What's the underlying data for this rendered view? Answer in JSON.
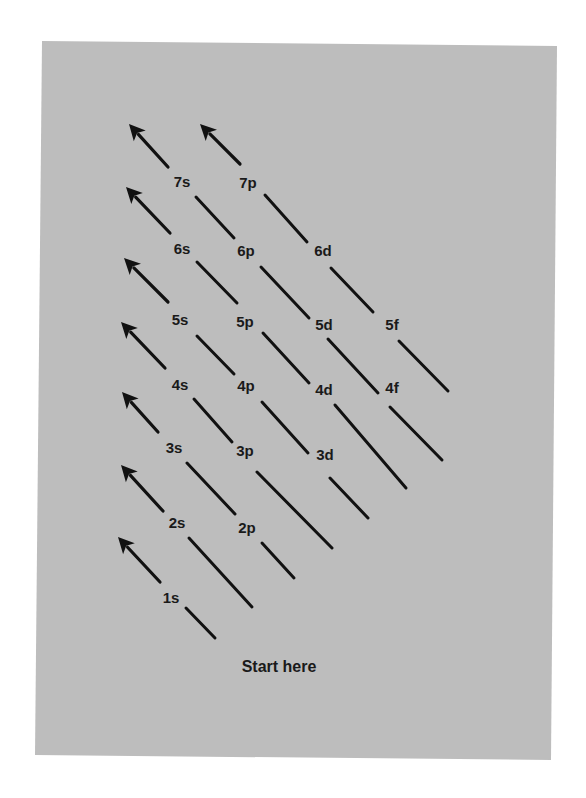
{
  "diagram": {
    "colors": {
      "page_background": "#ffffff",
      "panel_background": "#bdbdbd",
      "ink": "#111111"
    },
    "panel_polygon": [
      [
        42,
        41
      ],
      [
        557,
        46
      ],
      [
        551,
        760
      ],
      [
        35,
        755
      ]
    ],
    "start_label": "Start here",
    "start_label_pos": [
      279,
      672
    ],
    "orbitals": [
      {
        "id": "1s",
        "label": "1s",
        "x": 171,
        "y": 603
      },
      {
        "id": "2s",
        "label": "2s",
        "x": 177,
        "y": 528
      },
      {
        "id": "2p",
        "label": "2p",
        "x": 247,
        "y": 533
      },
      {
        "id": "3s",
        "label": "3s",
        "x": 174,
        "y": 453
      },
      {
        "id": "3p",
        "label": "3p",
        "x": 245,
        "y": 456
      },
      {
        "id": "3d",
        "label": "3d",
        "x": 325,
        "y": 460
      },
      {
        "id": "4s",
        "label": "4s",
        "x": 180,
        "y": 390
      },
      {
        "id": "4p",
        "label": "4p",
        "x": 246,
        "y": 391
      },
      {
        "id": "4d",
        "label": "4d",
        "x": 324,
        "y": 395
      },
      {
        "id": "4f",
        "label": "4f",
        "x": 392,
        "y": 393
      },
      {
        "id": "5s",
        "label": "5s",
        "x": 180,
        "y": 325
      },
      {
        "id": "5p",
        "label": "5p",
        "x": 245,
        "y": 327
      },
      {
        "id": "5d",
        "label": "5d",
        "x": 324,
        "y": 330
      },
      {
        "id": "5f",
        "label": "5f",
        "x": 392,
        "y": 330
      },
      {
        "id": "6s",
        "label": "6s",
        "x": 182,
        "y": 254
      },
      {
        "id": "6p",
        "label": "6p",
        "x": 246,
        "y": 256
      },
      {
        "id": "6d",
        "label": "6d",
        "x": 323,
        "y": 256
      },
      {
        "id": "7s",
        "label": "7s",
        "x": 182,
        "y": 187
      },
      {
        "id": "7p",
        "label": "7p",
        "x": 248,
        "y": 188
      }
    ],
    "arrows": [
      {
        "id": "arrow-1s",
        "from": [
          160,
          582
        ],
        "to": [
          118,
          537
        ]
      },
      {
        "id": "arrow-2s",
        "from": [
          163,
          511
        ],
        "to": [
          121,
          465
        ]
      },
      {
        "id": "arrow-3s",
        "from": [
          158,
          432
        ],
        "to": [
          122,
          392
        ]
      },
      {
        "id": "arrow-4s",
        "from": [
          165,
          368
        ],
        "to": [
          121,
          322
        ]
      },
      {
        "id": "arrow-5s",
        "from": [
          168,
          302
        ],
        "to": [
          124,
          258
        ]
      },
      {
        "id": "arrow-6s",
        "from": [
          170,
          233
        ],
        "to": [
          126,
          187
        ]
      },
      {
        "id": "arrow-7s",
        "from": [
          168,
          167
        ],
        "to": [
          129,
          124
        ]
      },
      {
        "id": "arrow-7p",
        "from": [
          240,
          164
        ],
        "to": [
          200,
          124
        ]
      }
    ],
    "lines": [
      {
        "id": "line-start-1s",
        "from": [
          186,
          608
        ],
        "to": [
          215,
          638
        ]
      },
      {
        "id": "line-2s-end",
        "from": [
          189,
          538
        ],
        "to": [
          252,
          607
        ]
      },
      {
        "id": "line-2p-end",
        "from": [
          262,
          543
        ],
        "to": [
          294,
          578
        ]
      },
      {
        "id": "line-3s-2p",
        "from": [
          187,
          463
        ],
        "to": [
          235,
          514
        ]
      },
      {
        "id": "line-3p-end",
        "from": [
          257,
          472
        ],
        "to": [
          332,
          548
        ]
      },
      {
        "id": "line-3d-end",
        "from": [
          330,
          478
        ],
        "to": [
          368,
          518
        ]
      },
      {
        "id": "line-4s-3p",
        "from": [
          194,
          399
        ],
        "to": [
          232,
          442
        ]
      },
      {
        "id": "line-4p-3d",
        "from": [
          262,
          402
        ],
        "to": [
          308,
          453
        ]
      },
      {
        "id": "line-4d-end",
        "from": [
          335,
          405
        ],
        "to": [
          406,
          488
        ]
      },
      {
        "id": "line-4f-end",
        "from": [
          390,
          407
        ],
        "to": [
          442,
          460
        ]
      },
      {
        "id": "line-5s-4p",
        "from": [
          197,
          336
        ],
        "to": [
          234,
          374
        ]
      },
      {
        "id": "line-5p-4d",
        "from": [
          263,
          333
        ],
        "to": [
          309,
          383
        ]
      },
      {
        "id": "line-5d-4f",
        "from": [
          328,
          339
        ],
        "to": [
          378,
          393
        ]
      },
      {
        "id": "line-5f-end",
        "from": [
          399,
          341
        ],
        "to": [
          448,
          391
        ]
      },
      {
        "id": "line-6s-5p",
        "from": [
          197,
          262
        ],
        "to": [
          237,
          303
        ]
      },
      {
        "id": "line-6p-5d",
        "from": [
          261,
          267
        ],
        "to": [
          309,
          318
        ]
      },
      {
        "id": "line-6d-5f",
        "from": [
          331,
          268
        ],
        "to": [
          373,
          312
        ]
      },
      {
        "id": "line-7s-6p",
        "from": [
          196,
          197
        ],
        "to": [
          234,
          238
        ]
      },
      {
        "id": "line-7p-6d",
        "from": [
          265,
          195
        ],
        "to": [
          307,
          242
        ]
      }
    ]
  }
}
